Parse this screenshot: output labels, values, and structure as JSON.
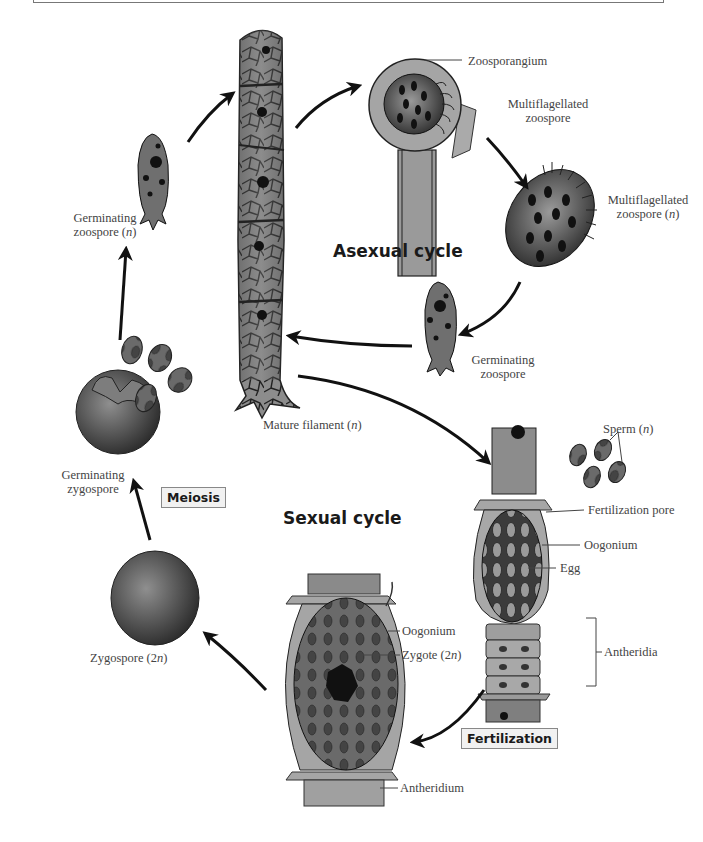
{
  "diagram": {
    "title_asexual": "Asexual cycle",
    "title_sexual": "Sexual cycle",
    "stages": {
      "meiosis": "Meiosis",
      "fertilization": "Fertilization"
    },
    "labels": {
      "zoosporangium": "Zoosporangium",
      "multiflagellated_zoospore_1": [
        "Multiflagellated",
        "zoospore"
      ],
      "multiflagellated_zoospore_2": [
        "Multiflagellated",
        "zoospore (",
        "n",
        ")"
      ],
      "germinating_zoospore_asexual": [
        "Germinating",
        "zoospore"
      ],
      "germinating_zoospore_n": [
        "Germinating",
        "zoospore (",
        "n",
        ")"
      ],
      "mature_filament": [
        "Mature filament (",
        "n",
        ")"
      ],
      "germinating_zygospore": [
        "Germinating",
        "zygospore"
      ],
      "sperm": [
        "Sperm (",
        "n",
        ")"
      ],
      "fertilization_pore": "Fertilization pore",
      "oogonium_right": "Oogonium",
      "egg": "Egg",
      "antheridia": "Antheridia",
      "oogonium_center": "Oogonium",
      "zygote": [
        "Zygote (2",
        "n",
        ")"
      ],
      "antheridium": "Antheridium",
      "zygospore": [
        "Zygospore (2",
        "n",
        ")"
      ]
    },
    "cycle_flow": [
      "Mature filament (n)",
      "Zoosporangium",
      "Multiflagellated zoospore (n)",
      "Germinating zoospore",
      "Mature filament (n)",
      "Fertilization",
      "Zygote (2n)",
      "Zygospore (2n)",
      "Meiosis / Germinating zygospore",
      "Germinating zoospore (n)",
      "Mature filament (n)"
    ],
    "colors": {
      "arrow": "#111111",
      "cell_fill": "#8a8a8a",
      "cell_dark": "#333333",
      "label_text": "#444444",
      "tag_bg": "#f1f1f1"
    }
  }
}
